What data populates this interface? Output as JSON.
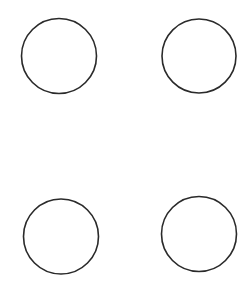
{
  "canvas": {
    "width": 252,
    "height": 300,
    "background": "#ffffff"
  },
  "shapes": [
    {
      "id": "circle-top-left",
      "type": "circle",
      "cx": 59,
      "cy": 56,
      "r": 37.5,
      "stroke": "#2a2a2a",
      "stroke_width": 1.6,
      "fill": "none"
    },
    {
      "id": "circle-top-right",
      "type": "circle",
      "cx": 199,
      "cy": 56,
      "r": 37,
      "stroke": "#2a2a2a",
      "stroke_width": 1.6,
      "fill": "none"
    },
    {
      "id": "circle-bottom-left",
      "type": "circle",
      "cx": 61,
      "cy": 236.5,
      "r": 37.5,
      "stroke": "#2a2a2a",
      "stroke_width": 1.6,
      "fill": "none"
    },
    {
      "id": "circle-bottom-right",
      "type": "circle",
      "cx": 199,
      "cy": 234,
      "r": 37.5,
      "stroke": "#2a2a2a",
      "stroke_width": 1.6,
      "fill": "none"
    }
  ]
}
